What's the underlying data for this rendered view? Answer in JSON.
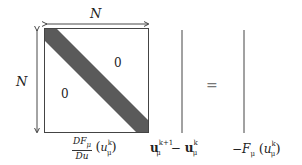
{
  "diagram": {
    "matrix": {
      "width_label": "N",
      "height_label": "N",
      "upper_zero": "0",
      "lower_zero": "0",
      "band_color": "#5a5a5a",
      "caption_numerator": "DF",
      "caption_numerator_sub": "μ",
      "caption_denominator": "Du",
      "caption_arg": "u",
      "caption_arg_sup": "k",
      "caption_arg_sub": "μ"
    },
    "unknown_vector": {
      "term1": "u",
      "term1_sup": "k+1",
      "term1_sub": "μ",
      "minus": "−",
      "term2": "u",
      "term2_sup": "k",
      "term2_sub": "μ"
    },
    "equals": "=",
    "rhs_vector": {
      "prefix": "−F",
      "prefix_sub": "μ",
      "arg": "u",
      "arg_sup": "k",
      "arg_sub": "μ"
    }
  }
}
